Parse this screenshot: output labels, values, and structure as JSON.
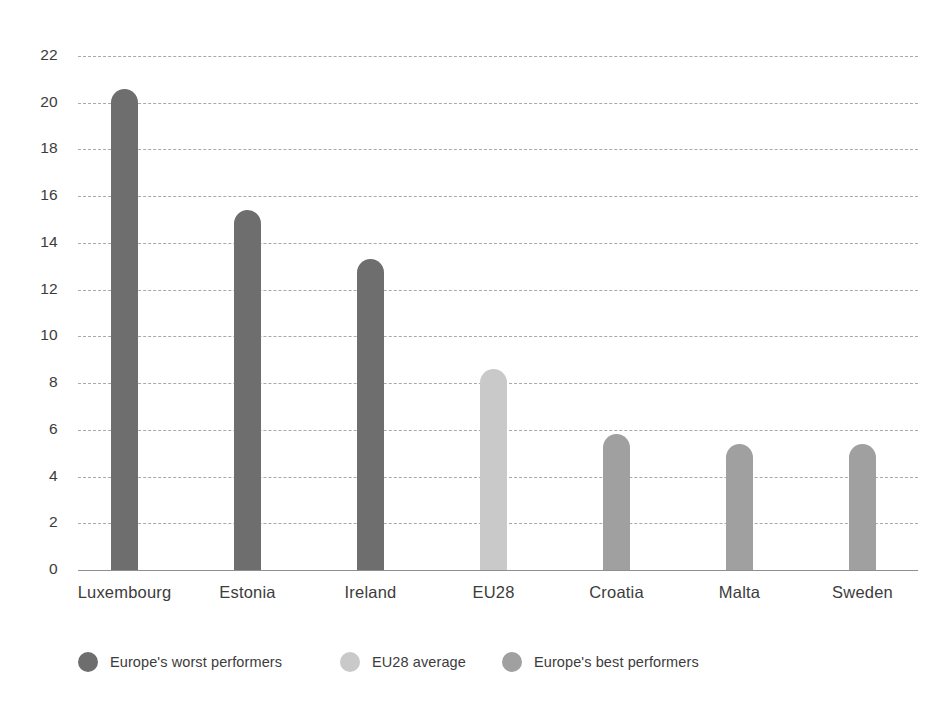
{
  "chart_data": {
    "type": "bar",
    "title": "",
    "subtitle": "",
    "xlabel": "",
    "ylabel": "",
    "categories": [
      "Luxembourg",
      "Estonia",
      "Ireland",
      "EU28",
      "Croatia",
      "Malta",
      "Sweden"
    ],
    "values": [
      20.6,
      15.4,
      13.3,
      8.6,
      5.8,
      5.4,
      5.4
    ],
    "groups": [
      "worst",
      "worst",
      "worst",
      "average",
      "best",
      "best",
      "best"
    ],
    "ylim": [
      0,
      22
    ],
    "ytick_values": [
      0,
      2,
      4,
      6,
      8,
      10,
      12,
      14,
      16,
      18,
      20,
      22
    ],
    "ytick_labels": [
      "0",
      "2",
      "4",
      "6",
      "8",
      "10",
      "12",
      "14",
      "16",
      "18",
      "20",
      "22"
    ],
    "grid": true,
    "grid_style": "dashed-horizontal",
    "legend_position": "bottom",
    "legend": [
      {
        "key": "worst",
        "label": "Europe's worst performers",
        "color": "#6e6e6e"
      },
      {
        "key": "average",
        "label": "EU28 average",
        "color": "#c9c9c9"
      },
      {
        "key": "best",
        "label": "Europe's best performers",
        "color": "#a0a0a0"
      }
    ],
    "colors": {
      "worst": "#6e6e6e",
      "average": "#c9c9c9",
      "best": "#a0a0a0",
      "grid": "#a9a9a9",
      "axis": "#8f8f8f",
      "text": "#3c3c3c",
      "background": "#ffffff"
    }
  }
}
